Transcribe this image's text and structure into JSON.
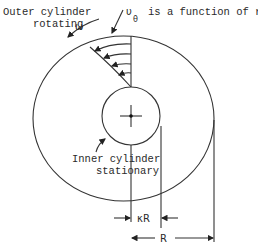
{
  "labels": {
    "outer_line1": "Outer cylinder",
    "outer_line2": "rotating",
    "omega": "ω",
    "v_symbol": "υ",
    "theta_sub": "θ",
    "velocity_text": "is a function of r",
    "inner_line1": "Inner cylinder",
    "inner_line2": "stationary",
    "kappa_r": "κR",
    "r": "R"
  },
  "colors": {
    "line": "#333333",
    "text": "#2a2a2a",
    "background": "#ffffff"
  }
}
